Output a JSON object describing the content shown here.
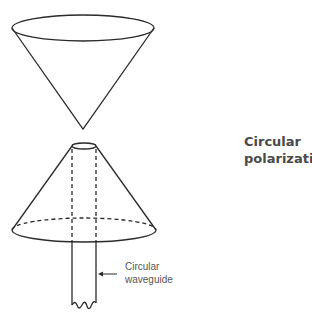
{
  "figure": {
    "title_line1": "Circular",
    "title_line2": "polarization",
    "waveguide_label_line1": "Circular",
    "waveguide_label_line2": "waveguide"
  },
  "components": [
    {
      "name": "reflector-cone",
      "description": "inverted cone"
    },
    {
      "name": "radiating-cone",
      "description": "upright cone with dashed rear base edge"
    },
    {
      "name": "circular-waveguide",
      "description": "feed waveguide with broken end"
    }
  ]
}
